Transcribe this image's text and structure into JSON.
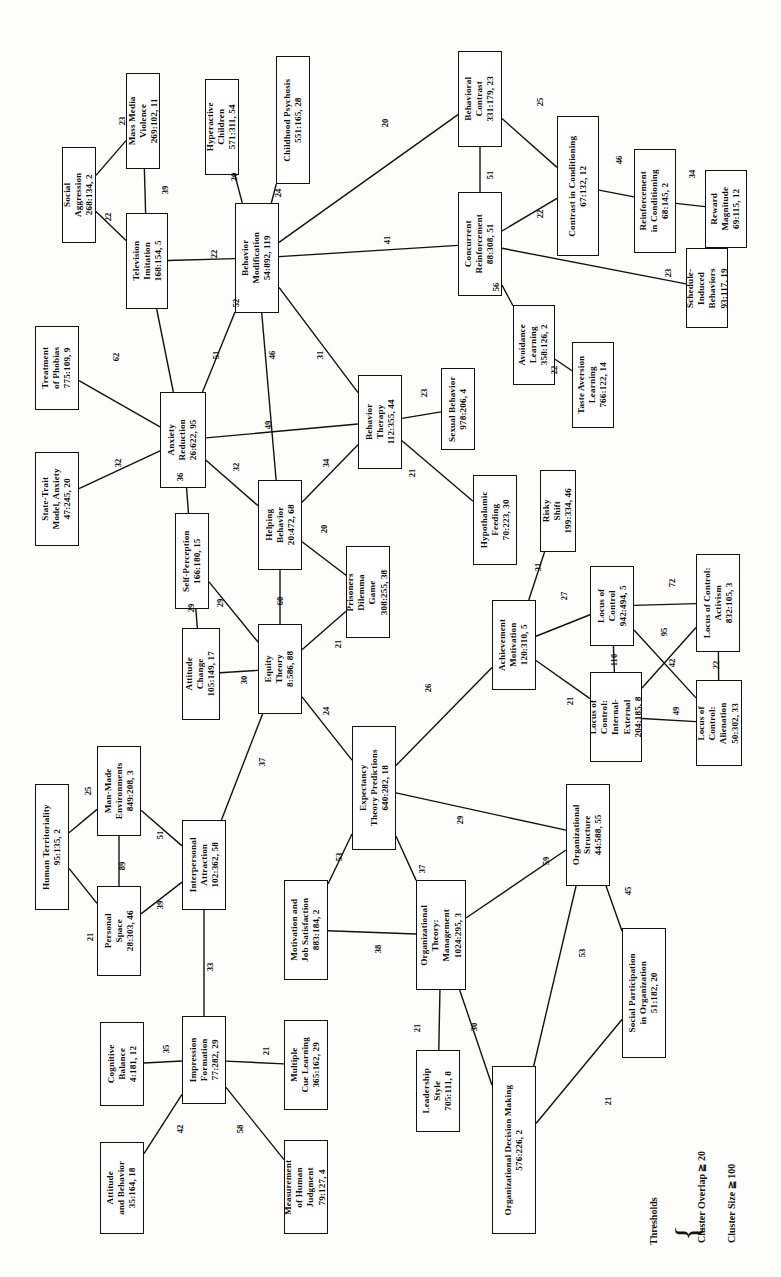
{
  "figure": {
    "type": "network-diagram",
    "orientation": "rotated-90-ccw"
  },
  "legend": {
    "title": "Thresholds",
    "line1": "Cluster Overlap ≧ 20",
    "line2": "Cluster Size ≧ 100"
  },
  "nodes": [
    {
      "id": "social_aggression",
      "label": [
        "Social",
        "Aggression"
      ],
      "stat": "268:134, 2",
      "x": 62,
      "y": 147,
      "w": 34,
      "h": 96
    },
    {
      "id": "mass_media_violence",
      "label": [
        "Mass Media",
        "Violence"
      ],
      "stat": "269:102, 11",
      "x": 126,
      "y": 73,
      "w": 34,
      "h": 96
    },
    {
      "id": "television_imitation",
      "label": [
        "Television",
        "Imitation"
      ],
      "stat": "168:154, 5",
      "x": 126,
      "y": 213,
      "w": 42,
      "h": 96
    },
    {
      "id": "hyperactive_children",
      "label": [
        "Hyperactive",
        "Children"
      ],
      "stat": "571:311, 54",
      "x": 205,
      "y": 79,
      "w": 34,
      "h": 96
    },
    {
      "id": "childhood_psychosis",
      "label": [
        "Childhood Psychosis"
      ],
      "stat": "551:165, 28",
      "x": 276,
      "y": 56,
      "w": 34,
      "h": 128
    },
    {
      "id": "behavior_modification",
      "label": [
        "Behavior",
        "Modification"
      ],
      "stat": "54:892, 119",
      "x": 235,
      "y": 203,
      "w": 44,
      "h": 110
    },
    {
      "id": "behavioral_contrast",
      "label": [
        "Behavioral",
        "Contrast"
      ],
      "stat": "331:179, 23",
      "x": 458,
      "y": 51,
      "w": 44,
      "h": 96
    },
    {
      "id": "concurrent_reinforcement",
      "label": [
        "Concurrent",
        "Reinforcement"
      ],
      "stat": "88:308, 51",
      "x": 458,
      "y": 192,
      "w": 44,
      "h": 104
    },
    {
      "id": "contrast_conditioning",
      "label": [
        "Contrast in Conditioning"
      ],
      "stat": "67:132, 12",
      "x": 557,
      "y": 116,
      "w": 42,
      "h": 140
    },
    {
      "id": "reinforcement_cond",
      "label": [
        "Reinforcement",
        "in Conditioning"
      ],
      "stat": "68:145, 2",
      "x": 634,
      "y": 149,
      "w": 42,
      "h": 104
    },
    {
      "id": "reward_magnitude",
      "label": [
        "Reward",
        "Magnitude"
      ],
      "stat": "69:115, 12",
      "x": 705,
      "y": 170,
      "w": 42,
      "h": 78
    },
    {
      "id": "schedule_induced",
      "label": [
        "Schedule-",
        "Induced",
        "Behaviors"
      ],
      "stat": "93:117, 19",
      "x": 686,
      "y": 248,
      "w": 42,
      "h": 80
    },
    {
      "id": "avoidance_learning",
      "label": [
        "Avoidance",
        "Learning"
      ],
      "stat": "358:126, 2",
      "x": 513,
      "y": 305,
      "w": 42,
      "h": 80
    },
    {
      "id": "taste_aversion",
      "label": [
        "Taste Aversion",
        "Learning"
      ],
      "stat": "766:122, 14",
      "x": 572,
      "y": 342,
      "w": 42,
      "h": 86
    },
    {
      "id": "sexual_behavior",
      "label": [
        "Sexual Behavior"
      ],
      "stat": "978:206, 4",
      "x": 441,
      "y": 368,
      "w": 34,
      "h": 82
    },
    {
      "id": "behavior_therapy",
      "label": [
        "Behavior",
        "Therapy"
      ],
      "stat": "112:355, 44",
      "x": 358,
      "y": 375,
      "w": 44,
      "h": 94
    },
    {
      "id": "hypothalamic_feeding",
      "label": [
        "Hypothalamic",
        "Feeding"
      ],
      "stat": "70:223, 30",
      "x": 473,
      "y": 475,
      "w": 44,
      "h": 90
    },
    {
      "id": "treatment_phobias",
      "label": [
        "Treatment",
        "of Phobias"
      ],
      "stat": "775:109, 9",
      "x": 35,
      "y": 326,
      "w": 44,
      "h": 84
    },
    {
      "id": "state_trait_anxiety",
      "label": [
        "State-Trait",
        "Model, Anxiety"
      ],
      "stat": "47:245, 20",
      "x": 35,
      "y": 452,
      "w": 44,
      "h": 94
    },
    {
      "id": "anxiety_reduction",
      "label": [
        "Anxiety",
        "Reduction"
      ],
      "stat": "26:622, 95",
      "x": 160,
      "y": 392,
      "w": 46,
      "h": 96
    },
    {
      "id": "self_perception",
      "label": [
        "Self-Perception"
      ],
      "stat": "166:180, 15",
      "x": 175,
      "y": 513,
      "w": 34,
      "h": 96
    },
    {
      "id": "helping_behavior",
      "label": [
        "Helping",
        "Behavior"
      ],
      "stat": "20:472, 68",
      "x": 258,
      "y": 480,
      "w": 44,
      "h": 90
    },
    {
      "id": "prisoners_dilemma",
      "label": [
        "Prisoners",
        "Dilemma",
        "Game"
      ],
      "stat": "308:255, 38",
      "x": 346,
      "y": 546,
      "w": 44,
      "h": 92
    },
    {
      "id": "attitude_change",
      "label": [
        "Attitude",
        "Change"
      ],
      "stat": "105:149, 17",
      "x": 182,
      "y": 628,
      "w": 38,
      "h": 92
    },
    {
      "id": "equity_theory",
      "label": [
        "Equity",
        "Theory"
      ],
      "stat": "8:586, 88",
      "x": 258,
      "y": 624,
      "w": 44,
      "h": 90
    },
    {
      "id": "risky_shift",
      "label": [
        "Risky",
        "Shift"
      ],
      "stat": "199:334, 46",
      "x": 540,
      "y": 470,
      "w": 36,
      "h": 82
    },
    {
      "id": "achievement_motivation",
      "label": [
        "Achievement",
        "Motivation"
      ],
      "stat": "120:310, 5",
      "x": 492,
      "y": 600,
      "w": 44,
      "h": 90
    },
    {
      "id": "locus_control",
      "label": [
        "Locus of",
        "Control"
      ],
      "stat": "942:494, 5",
      "x": 590,
      "y": 566,
      "w": 44,
      "h": 80
    },
    {
      "id": "locus_activism",
      "label": [
        "Locus of Control:",
        "Activism"
      ],
      "stat": "832:105, 3",
      "x": 696,
      "y": 554,
      "w": 44,
      "h": 98
    },
    {
      "id": "locus_int_ext",
      "label": [
        "Locus of",
        "Control:",
        "Internal-",
        "External"
      ],
      "stat": "204:185, 8",
      "x": 590,
      "y": 672,
      "w": 52,
      "h": 90
    },
    {
      "id": "locus_alienation",
      "label": [
        "Locus of",
        "Control:",
        "Alienation"
      ],
      "stat": "50:302, 33",
      "x": 696,
      "y": 680,
      "w": 46,
      "h": 86
    },
    {
      "id": "expectancy_theory",
      "label": [
        "Expectancy",
        "Theory Predictions"
      ],
      "stat": "640:282, 18",
      "x": 352,
      "y": 726,
      "w": 44,
      "h": 124
    },
    {
      "id": "human_territoriality",
      "label": [
        "Human Territoriality"
      ],
      "stat": "95:135, 2",
      "x": 35,
      "y": 784,
      "w": 34,
      "h": 126
    },
    {
      "id": "man_made_env",
      "label": [
        "Man-Made",
        "Environments"
      ],
      "stat": "849:208, 3",
      "x": 97,
      "y": 746,
      "w": 44,
      "h": 90
    },
    {
      "id": "personal_space",
      "label": [
        "Personal",
        "Space"
      ],
      "stat": "28:303, 46",
      "x": 97,
      "y": 886,
      "w": 44,
      "h": 90
    },
    {
      "id": "interpersonal_attraction",
      "label": [
        "Interpersonal",
        "Attraction"
      ],
      "stat": "102:362, 58",
      "x": 182,
      "y": 820,
      "w": 44,
      "h": 90
    },
    {
      "id": "motivation_job_sat",
      "label": [
        "Motivation and",
        "Job Satisfaction"
      ],
      "stat": "883:184, 2",
      "x": 284,
      "y": 880,
      "w": 44,
      "h": 100
    },
    {
      "id": "org_theory_mgmt",
      "label": [
        "Organizational",
        "Theory:",
        "Management"
      ],
      "stat": "1024:295, 3",
      "x": 416,
      "y": 880,
      "w": 50,
      "h": 110
    },
    {
      "id": "org_structure",
      "label": [
        "Organizational",
        "Structure"
      ],
      "stat": "44:588, 55",
      "x": 566,
      "y": 784,
      "w": 44,
      "h": 102
    },
    {
      "id": "social_participation",
      "label": [
        "Social Participation",
        "in Organization"
      ],
      "stat": "51:182, 20",
      "x": 622,
      "y": 928,
      "w": 44,
      "h": 130
    },
    {
      "id": "cognitive_balance",
      "label": [
        "Cognitive",
        "Balance"
      ],
      "stat": "4:181, 12",
      "x": 100,
      "y": 1022,
      "w": 44,
      "h": 84
    },
    {
      "id": "impression_formation",
      "label": [
        "Impression",
        "Formation"
      ],
      "stat": "77:282, 29",
      "x": 182,
      "y": 1016,
      "w": 44,
      "h": 88
    },
    {
      "id": "multiple_cue_learning",
      "label": [
        "Multiple",
        "Cue Learning"
      ],
      "stat": "365:162, 29",
      "x": 284,
      "y": 1020,
      "w": 44,
      "h": 90
    },
    {
      "id": "attitude_behavior",
      "label": [
        "Attitude",
        "and Behavior"
      ],
      "stat": "35:164, 18",
      "x": 100,
      "y": 1142,
      "w": 44,
      "h": 92
    },
    {
      "id": "measurement_judgment",
      "label": [
        "Measurement",
        "of Human",
        "Judgment"
      ],
      "stat": "79:127, 4",
      "x": 284,
      "y": 1140,
      "w": 44,
      "h": 94
    },
    {
      "id": "leadership_style",
      "label": [
        "Leadership",
        "Style"
      ],
      "stat": "705:111, 8",
      "x": 416,
      "y": 1050,
      "w": 44,
      "h": 82
    },
    {
      "id": "org_decision_making",
      "label": [
        "Organizational Decision Making"
      ],
      "stat": "576:226, 2",
      "x": 492,
      "y": 1066,
      "w": 44,
      "h": 168
    }
  ],
  "edges": [
    {
      "from": "social_aggression",
      "to": "mass_media_violence",
      "weight": "23",
      "lx": 118,
      "ly": 116
    },
    {
      "from": "social_aggression",
      "to": "television_imitation",
      "weight": "22",
      "lx": 104,
      "ly": 212
    },
    {
      "from": "mass_media_violence",
      "to": "television_imitation",
      "weight": "39",
      "lx": 161,
      "ly": 185
    },
    {
      "from": "television_imitation",
      "to": "behavior_modification",
      "weight": "22",
      "lx": 210,
      "ly": 249
    },
    {
      "from": "television_imitation",
      "to": "anxiety_reduction",
      "weight": "51",
      "lx": 212,
      "ly": 350
    },
    {
      "from": "hyperactive_children",
      "to": "behavior_modification",
      "weight": "20",
      "lx": 230,
      "ly": 172
    },
    {
      "from": "childhood_psychosis",
      "to": "behavior_modification",
      "weight": "24",
      "lx": 274,
      "ly": 188
    },
    {
      "from": "behavior_modification",
      "to": "behavioral_contrast",
      "weight": "20",
      "lx": 381,
      "ly": 118
    },
    {
      "from": "behavior_modification",
      "to": "concurrent_reinforcement",
      "weight": "41",
      "lx": 383,
      "ly": 235
    },
    {
      "from": "behavior_modification",
      "to": "anxiety_reduction",
      "weight": "52",
      "lx": 232,
      "ly": 298
    },
    {
      "from": "behavior_modification",
      "to": "helping_behavior",
      "weight": "46",
      "lx": 268,
      "ly": 350
    },
    {
      "from": "behavior_modification",
      "to": "behavior_therapy",
      "weight": "31",
      "lx": 316,
      "ly": 350
    },
    {
      "from": "behavioral_contrast",
      "to": "contrast_conditioning",
      "weight": "25",
      "lx": 536,
      "ly": 97
    },
    {
      "from": "behavioral_contrast",
      "to": "concurrent_reinforcement",
      "weight": "51",
      "lx": 486,
      "ly": 170
    },
    {
      "from": "concurrent_reinforcement",
      "to": "contrast_conditioning",
      "weight": "22",
      "lx": 536,
      "ly": 209
    },
    {
      "from": "concurrent_reinforcement",
      "to": "schedule_induced",
      "weight": "23",
      "lx": 664,
      "ly": 268
    },
    {
      "from": "concurrent_reinforcement",
      "to": "avoidance_learning",
      "weight": "56",
      "lx": 492,
      "ly": 282
    },
    {
      "from": "contrast_conditioning",
      "to": "reinforcement_cond",
      "weight": "46",
      "lx": 615,
      "ly": 155
    },
    {
      "from": "reinforcement_cond",
      "to": "reward_magnitude",
      "weight": "34",
      "lx": 688,
      "ly": 169
    },
    {
      "from": "avoidance_learning",
      "to": "taste_aversion",
      "weight": "22",
      "lx": 550,
      "ly": 365
    },
    {
      "from": "behavior_therapy",
      "to": "sexual_behavior",
      "weight": "23",
      "lx": 420,
      "ly": 388
    },
    {
      "from": "behavior_therapy",
      "to": "hypothalamic_feeding",
      "weight": "21",
      "lx": 408,
      "ly": 468
    },
    {
      "from": "behavior_therapy",
      "to": "anxiety_reduction",
      "weight": "49",
      "lx": 264,
      "ly": 420
    },
    {
      "from": "behavior_therapy",
      "to": "helping_behavior",
      "weight": "34",
      "lx": 322,
      "ly": 458
    },
    {
      "from": "anxiety_reduction",
      "to": "treatment_phobias",
      "weight": "62",
      "lx": 112,
      "ly": 352
    },
    {
      "from": "anxiety_reduction",
      "to": "state_trait_anxiety",
      "weight": "32",
      "lx": 114,
      "ly": 458
    },
    {
      "from": "anxiety_reduction",
      "to": "self_perception",
      "weight": "36",
      "lx": 176,
      "ly": 472
    },
    {
      "from": "anxiety_reduction",
      "to": "helping_behavior",
      "weight": "32",
      "lx": 232,
      "ly": 462
    },
    {
      "from": "self_perception",
      "to": "attitude_change",
      "weight": "29",
      "lx": 187,
      "ly": 603
    },
    {
      "from": "self_perception",
      "to": "equity_theory",
      "weight": "29",
      "lx": 216,
      "ly": 598
    },
    {
      "from": "helping_behavior",
      "to": "equity_theory",
      "weight": "60",
      "lx": 276,
      "ly": 596
    },
    {
      "from": "helping_behavior",
      "to": "prisoners_dilemma",
      "weight": "20",
      "lx": 320,
      "ly": 524
    },
    {
      "from": "equity_theory",
      "to": "attitude_change",
      "weight": "30",
      "lx": 240,
      "ly": 675
    },
    {
      "from": "equity_theory",
      "to": "prisoners_dilemma",
      "weight": "21",
      "lx": 334,
      "ly": 639
    },
    {
      "from": "equity_theory",
      "to": "expectancy_theory",
      "weight": "24",
      "lx": 322,
      "ly": 706
    },
    {
      "from": "equity_theory",
      "to": "interpersonal_attraction",
      "weight": "37",
      "lx": 258,
      "ly": 757
    },
    {
      "from": "expectancy_theory",
      "to": "achievement_motivation",
      "weight": "26",
      "lx": 424,
      "ly": 683
    },
    {
      "from": "expectancy_theory",
      "to": "motivation_job_sat",
      "weight": "53",
      "lx": 335,
      "ly": 852
    },
    {
      "from": "expectancy_theory",
      "to": "org_theory_mgmt",
      "weight": "37",
      "lx": 418,
      "ly": 864
    },
    {
      "from": "expectancy_theory",
      "to": "org_structure",
      "weight": "29",
      "lx": 456,
      "ly": 815
    },
    {
      "from": "achievement_motivation",
      "to": "risky_shift",
      "weight": "31",
      "lx": 534,
      "ly": 562
    },
    {
      "from": "achievement_motivation",
      "to": "locus_control",
      "weight": "27",
      "lx": 560,
      "ly": 591
    },
    {
      "from": "achievement_motivation",
      "to": "locus_int_ext",
      "weight": "21",
      "lx": 566,
      "ly": 696
    },
    {
      "from": "locus_control",
      "to": "locus_activism",
      "weight": "72",
      "lx": 668,
      "ly": 578
    },
    {
      "from": "locus_control",
      "to": "locus_int_ext",
      "weight": "110",
      "lx": 608,
      "ly": 655
    },
    {
      "from": "locus_control",
      "to": "locus_alienation",
      "weight": "95",
      "lx": 660,
      "ly": 627
    },
    {
      "from": "locus_int_ext",
      "to": "locus_activism",
      "weight": "42",
      "lx": 668,
      "ly": 658
    },
    {
      "from": "locus_int_ext",
      "to": "locus_alienation",
      "weight": "49",
      "lx": 672,
      "ly": 706
    },
    {
      "from": "locus_activism",
      "to": "locus_alienation",
      "weight": "22",
      "lx": 712,
      "ly": 660
    },
    {
      "from": "human_territoriality",
      "to": "man_made_env",
      "weight": "25",
      "lx": 84,
      "ly": 786
    },
    {
      "from": "human_territoriality",
      "to": "personal_space",
      "weight": "21",
      "lx": 86,
      "ly": 932
    },
    {
      "from": "man_made_env",
      "to": "personal_space",
      "weight": "89",
      "lx": 118,
      "ly": 861
    },
    {
      "from": "man_made_env",
      "to": "interpersonal_attraction",
      "weight": "51",
      "lx": 156,
      "ly": 830
    },
    {
      "from": "personal_space",
      "to": "interpersonal_attraction",
      "weight": "39",
      "lx": 156,
      "ly": 900
    },
    {
      "from": "interpersonal_attraction",
      "to": "impression_formation",
      "weight": "33",
      "lx": 206,
      "ly": 962
    },
    {
      "from": "motivation_job_sat",
      "to": "org_theory_mgmt",
      "weight": "38",
      "lx": 374,
      "ly": 944
    },
    {
      "from": "org_theory_mgmt",
      "to": "org_structure",
      "weight": "59",
      "lx": 542,
      "ly": 856
    },
    {
      "from": "org_theory_mgmt",
      "to": "leadership_style",
      "weight": "21",
      "lx": 413,
      "ly": 1023
    },
    {
      "from": "org_theory_mgmt",
      "to": "org_decision_making",
      "weight": "30",
      "lx": 470,
      "ly": 1022
    },
    {
      "from": "org_structure",
      "to": "org_decision_making",
      "weight": "53",
      "lx": 578,
      "ly": 948
    },
    {
      "from": "org_structure",
      "to": "social_participation",
      "weight": "45",
      "lx": 624,
      "ly": 886
    },
    {
      "from": "org_decision_making",
      "to": "social_participation",
      "weight": "21",
      "lx": 604,
      "ly": 1096
    },
    {
      "from": "cognitive_balance",
      "to": "impression_formation",
      "weight": "35",
      "lx": 162,
      "ly": 1044
    },
    {
      "from": "impression_formation",
      "to": "multiple_cue_learning",
      "weight": "21",
      "lx": 262,
      "ly": 1046
    },
    {
      "from": "impression_formation",
      "to": "attitude_behavior",
      "weight": "42",
      "lx": 176,
      "ly": 1124
    },
    {
      "from": "impression_formation",
      "to": "measurement_judgment",
      "weight": "58",
      "lx": 236,
      "ly": 1124
    }
  ]
}
